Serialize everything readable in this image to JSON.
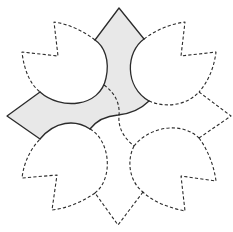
{
  "diagram": {
    "type": "geometric-tessellation",
    "colors": {
      "background": "#ffffff",
      "stroke": "#2b2b2b",
      "shaded_fill": "#e8e8e8"
    },
    "outer_points": {
      "top": [
        119,
        8
      ],
      "left": [
        7,
        116
      ],
      "right": [
        231,
        116
      ],
      "bottom": [
        118,
        225
      ]
    },
    "notches": {
      "top_left": {
        "tip_a": [
          54,
          22
        ],
        "inner": [
          58,
          56
        ],
        "tip_b": [
          22,
          52
        ]
      },
      "top_right": {
        "tip_a": [
          185,
          22
        ],
        "inner": [
          181,
          56
        ],
        "tip_b": [
          216,
          52
        ]
      },
      "bottom_left": {
        "tip_a": [
          22,
          178
        ],
        "inner": [
          57,
          175
        ],
        "tip_b": [
          52,
          210
        ]
      },
      "bottom_right": {
        "tip_a": [
          216,
          181
        ],
        "inner": [
          181,
          176
        ],
        "tip_b": [
          185,
          211
        ]
      }
    },
    "shaded_region": {
      "label": "highlighted piece",
      "style": "solid outline, light grey fill"
    },
    "labels": []
  }
}
